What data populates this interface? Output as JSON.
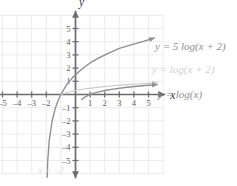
{
  "chart_data": {
    "type": "line",
    "title": "",
    "xlabel": "x",
    "ylabel": "y",
    "xlim": [
      -6.2,
      6.2
    ],
    "ylim": [
      -6.2,
      6.2
    ],
    "grid": true,
    "legend_position": "inline-right",
    "x_ticks": [
      -5,
      -4,
      -3,
      -2,
      1,
      2,
      3,
      4,
      5
    ],
    "y_ticks": [
      5,
      4,
      3,
      2,
      1,
      -1,
      -2,
      -3,
      -4,
      -5
    ],
    "x_tick_labels": [
      "-5",
      "-4",
      "-3",
      "-2",
      "1",
      "2",
      "3",
      "4",
      "5"
    ],
    "y_tick_labels": [
      "5",
      "4",
      "3",
      "2",
      "1",
      "-1",
      "-2",
      "-3",
      "-4",
      "-5"
    ],
    "annotations": [
      {
        "text": "x = -2",
        "type": "vertical-asymptote",
        "x": -2
      }
    ],
    "series": [
      {
        "name": "y = 5 log(x + 2)",
        "label": "y = 5 log(x + 2)",
        "color": "#8e8e90",
        "asymptote_x": -2,
        "x": [
          -1.96,
          -1.9,
          -1.8,
          -1.6,
          -1.4,
          -1.2,
          -1.0,
          -0.6,
          -0.2,
          0.4,
          1.0,
          1.6,
          2.2,
          3.0,
          3.8,
          4.6,
          5.4
        ],
        "y": [
          -7.0,
          -5.0,
          -3.49,
          -1.99,
          -1.11,
          -0.48,
          0.0,
          0.75,
          1.28,
          1.9,
          2.39,
          2.78,
          3.1,
          3.49,
          3.76,
          4.0,
          4.28
        ]
      },
      {
        "name": "y = log(x + 2)",
        "label": "y = log(x + 2)",
        "color": "#c9c9cc",
        "asymptote_x": -2,
        "x": [
          -1.0,
          -0.5,
          0.0,
          0.6,
          1.2,
          1.8,
          2.6,
          3.4,
          4.2,
          5.0,
          5.6
        ],
        "y": [
          0.0,
          0.176,
          0.301,
          0.415,
          0.505,
          0.58,
          0.663,
          0.732,
          0.792,
          0.845,
          0.881
        ]
      },
      {
        "name": "y = log(x)",
        "label": "y = log(x)",
        "color": "#8e8e90",
        "asymptote_x": 0,
        "x": [
          0.42,
          0.55,
          0.7,
          0.9,
          1.2,
          1.6,
          2.1,
          2.7,
          3.4,
          4.2,
          5.0,
          5.6
        ],
        "y": [
          -0.377,
          -0.26,
          -0.155,
          -0.046,
          0.079,
          0.204,
          0.322,
          0.431,
          0.531,
          0.623,
          0.699,
          0.748
        ]
      }
    ]
  },
  "axes": {
    "x_axis_label": "x",
    "y_axis_label": "y"
  },
  "labels": {
    "curve_a": "y = 5 log(x + 2)",
    "curve_b": "y = log(x + 2)",
    "curve_c": "y = log(x)",
    "asymptote": "x = –2"
  },
  "colors": {
    "grid": "#ececed",
    "axis": "#6b6b70",
    "curve_dark": "#8e8e90",
    "curve_light": "#c9c9cc",
    "tick_text": "#5d5d62",
    "faint_text": "#e2e2e4"
  }
}
